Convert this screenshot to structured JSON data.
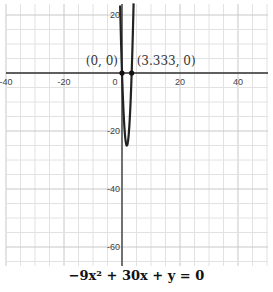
{
  "chart_data": {
    "type": "line",
    "title": "",
    "equation": "-9x^2 + 30x + y = 0",
    "function": "y = 9x^2 - 30x",
    "xlabel": "",
    "ylabel": "",
    "xlim": [
      -42,
      48
    ],
    "ylim": [
      -68,
      22
    ],
    "grid": true,
    "x_ticks": [
      -40,
      -20,
      0,
      20,
      40
    ],
    "y_ticks": [
      20,
      -20,
      -40,
      -60
    ],
    "series": [
      {
        "name": "-9x^2 + 30x + y = 0",
        "type": "parabola",
        "vertex": [
          1.667,
          -25
        ],
        "color": "#222222"
      }
    ],
    "points": [
      {
        "label": "(0, 0)",
        "x": 0,
        "y": 0
      },
      {
        "label": "(3.333, 0)",
        "x": 3.333,
        "y": 0
      }
    ]
  },
  "labels": {
    "equation_html": "−9x² + 30x + y = 0",
    "origin_tick": "0"
  }
}
